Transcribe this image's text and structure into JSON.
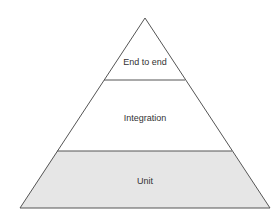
{
  "diagram": {
    "type": "test-pyramid",
    "layers": [
      {
        "id": "end-to-end",
        "label": "End to end",
        "fill": "#ffffff"
      },
      {
        "id": "integration",
        "label": "Integration",
        "fill": "#ffffff"
      },
      {
        "id": "unit",
        "label": "Unit",
        "fill": "#e6e6e6"
      }
    ],
    "colors": {
      "stroke": "#555555",
      "text": "#333333",
      "background": "#ffffff"
    }
  }
}
